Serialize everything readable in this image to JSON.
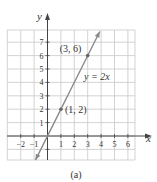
{
  "chart_data": {
    "type": "line",
    "title": "",
    "caption": "(a)",
    "xlabel": "x",
    "ylabel": "y",
    "xlim": [
      -3,
      6.6
    ],
    "ylim": [
      -1.8,
      7.9
    ],
    "grid": true,
    "x_ticks": [
      -2,
      -1,
      1,
      2,
      3,
      4,
      5,
      6
    ],
    "y_ticks": [
      1,
      2,
      3,
      4,
      5,
      6,
      7
    ],
    "series": [
      {
        "name": "y = 2x",
        "equation": "y = 2x",
        "slope": 2,
        "intercept": 0,
        "x_range": [
          -0.9,
          3.9
        ],
        "color": "#8a8a8a"
      }
    ],
    "points": [
      {
        "x": 1,
        "y": 2,
        "label": "(1, 2)"
      },
      {
        "x": 3,
        "y": 6,
        "label": "(3, 6)"
      }
    ],
    "annotations": [
      {
        "text": "y = 2x",
        "x": 2.6,
        "y": 4.2
      }
    ]
  },
  "colors": {
    "grid": "#c8c8c8",
    "axis": "#444444",
    "line": "#8a8a8a",
    "text": "#333333"
  }
}
